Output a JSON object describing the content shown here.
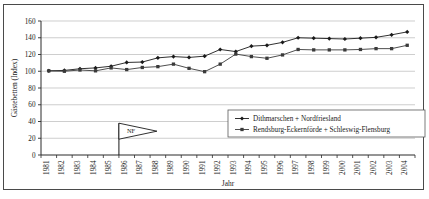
{
  "chart_data": {
    "type": "line",
    "title": "",
    "xlabel": "Jahr",
    "ylabel": "Gästebetten (Index)",
    "ylim": [
      0,
      160
    ],
    "ytick_step": 20,
    "yticks": [
      0,
      20,
      40,
      60,
      80,
      100,
      120,
      140,
      160
    ],
    "grid": true,
    "grid_axis": "y",
    "legend_position": "inside-bottom-right",
    "categories": [
      "1981",
      "1982",
      "1983",
      "1984",
      "1985",
      "1986",
      "1987",
      "1988",
      "1989",
      "1990",
      "1991",
      "1992",
      "1993",
      "1994",
      "1995",
      "1996",
      "1997",
      "1998",
      "1999",
      "2000",
      "2001",
      "2002",
      "2003",
      "2004"
    ],
    "series": [
      {
        "name": "Dithmarschen + Nordfriesland",
        "marker": "diamond",
        "color": "#1a1a1a",
        "values": [
          100.5,
          101,
          103,
          104,
          106,
          110.5,
          111,
          116,
          117.5,
          116.5,
          118,
          126,
          123.5,
          130,
          131,
          134.5,
          140,
          139.5,
          139,
          138.5,
          139.5,
          140.5,
          143.5,
          147
        ]
      },
      {
        "name": "Rendsburg-Eckernförde + Schleswig-Flensburg",
        "marker": "square",
        "color": "#3a3a3a",
        "values": [
          100.5,
          100,
          101.5,
          100.5,
          104,
          102,
          104.5,
          105.5,
          108.5,
          103.5,
          99.5,
          108.5,
          120.5,
          117.5,
          115.5,
          119.5,
          126,
          125.5,
          125.5,
          125.5,
          126,
          127,
          127,
          131
        ]
      }
    ],
    "annotations": [
      {
        "label": "NF",
        "type": "pennant-flag",
        "at_category": "1985",
        "pole_bottom_value": 0,
        "pole_top_value": 38
      }
    ]
  },
  "axis": {
    "y_label": "Gästebetten (Index)",
    "x_label": "Jahr"
  }
}
